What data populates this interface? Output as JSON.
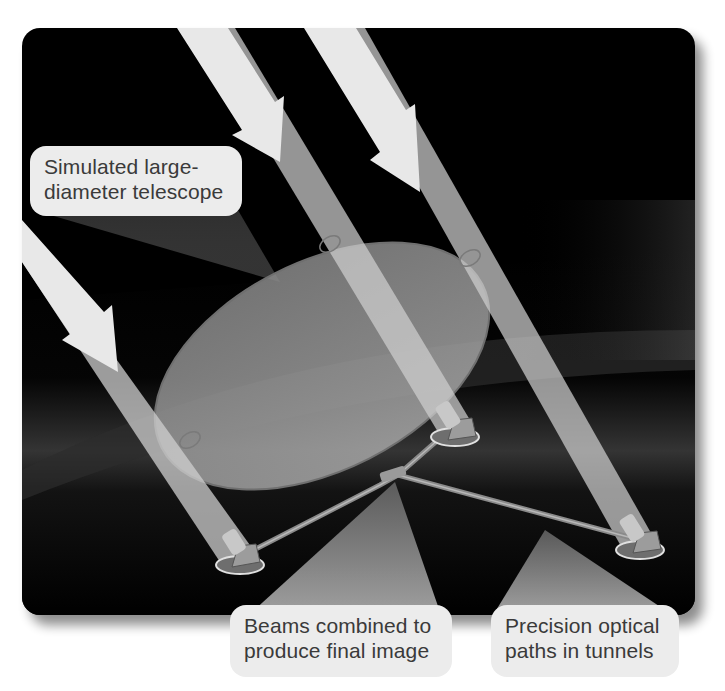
{
  "figure": {
    "background_color": "#000000",
    "beam_color": "#d8d8d8",
    "mirror_color": "#9a9a9a"
  },
  "labels": {
    "telescope": {
      "line1": "Simulated large-",
      "line2": "diameter telescope"
    },
    "beams_combined": {
      "line1": "Beams combined to",
      "line2": "produce final image"
    },
    "optical_paths": {
      "line1": "Precision optical",
      "line2": "paths in tunnels"
    }
  },
  "elements": {
    "incoming_light_beams": 3,
    "telescope_stations": 3,
    "beam_combiner_junction": 1
  }
}
